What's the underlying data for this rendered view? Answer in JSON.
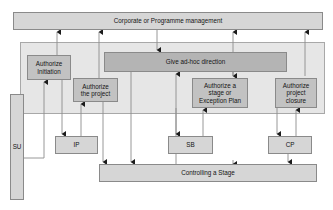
{
  "diagram": {
    "type": "process-flow-diagram",
    "colors": {
      "page_background": "#ffffff",
      "container_fill": "#e6e6e6",
      "box_fill_light": "#d6d6d6",
      "box_fill_mid": "#c2c2c2",
      "box_fill_dark": "#b4b4b4",
      "border": "#8a8a8a",
      "line": "#7a7a7a",
      "text": "#141414"
    },
    "top_banner": {
      "label": "Corporate or Programme management",
      "x": 13,
      "y": 12,
      "w": 310,
      "h": 18
    },
    "container": {
      "label": "",
      "x": 20,
      "y": 42,
      "w": 305,
      "h": 72
    },
    "processes": [
      {
        "id": "authorize-initiation",
        "label": "Authorize\nInitiation",
        "fill": "mid",
        "x": 27,
        "y": 55,
        "w": 44,
        "h": 25
      },
      {
        "id": "authorize-the-project",
        "label": "Authorize\nthe project",
        "fill": "mid",
        "x": 73,
        "y": 78,
        "w": 45,
        "h": 24
      },
      {
        "id": "give-ad-hoc-direction",
        "label": "Give ad-hoc direction",
        "fill": "dark",
        "x": 104,
        "y": 52,
        "w": 183,
        "h": 20
      },
      {
        "id": "authorize-a-stage-or-exception-plan",
        "label": "Authorize a\nstage or\nException Plan",
        "fill": "mid",
        "x": 192,
        "y": 78,
        "w": 56,
        "h": 30
      },
      {
        "id": "authorize-project-closure",
        "label": "Authorize\nproject\nclosure",
        "fill": "mid",
        "x": 275,
        "y": 78,
        "w": 42,
        "h": 30
      }
    ],
    "stage_boxes": [
      {
        "id": "su",
        "label": "SU",
        "fill": "light",
        "x": 10,
        "y": 94,
        "w": 14,
        "h": 106
      },
      {
        "id": "ip",
        "label": "IP",
        "fill": "light",
        "x": 55,
        "y": 136,
        "w": 43,
        "h": 18
      },
      {
        "id": "sb",
        "label": "SB",
        "fill": "light",
        "x": 168,
        "y": 136,
        "w": 45,
        "h": 18
      },
      {
        "id": "cp",
        "label": "CP",
        "fill": "light",
        "x": 268,
        "y": 136,
        "w": 44,
        "h": 18
      }
    ],
    "bottom_bar": {
      "id": "controlling-a-stage",
      "label": "Controlling a Stage",
      "fill": "light",
      "x": 99,
      "y": 164,
      "w": 218,
      "h": 18
    },
    "connectors": [
      {
        "id": "su-to-authorize-initiation",
        "from": "su",
        "to": "authorize-initiation"
      },
      {
        "id": "authorize-initiation-to-corporate",
        "from": "authorize-initiation",
        "to": "top-banner"
      },
      {
        "id": "authorize-initiation-to-ip",
        "from": "authorize-initiation",
        "to": "ip"
      },
      {
        "id": "ip-to-authorize-the-project",
        "from": "ip",
        "to": "authorize-the-project"
      },
      {
        "id": "authorize-the-project-to-corporate",
        "from": "authorize-the-project",
        "to": "top-banner"
      },
      {
        "id": "authorize-the-project-to-controlling",
        "from": "authorize-the-project",
        "to": "controlling-a-stage"
      },
      {
        "id": "corporate-to-give-ad-hoc",
        "from": "top-banner",
        "to": "give-ad-hoc-direction"
      },
      {
        "id": "controlling-to-give-ad-hoc",
        "from": "controlling-a-stage",
        "to": "give-ad-hoc-direction"
      },
      {
        "id": "give-ad-hoc-to-controlling",
        "from": "give-ad-hoc-direction",
        "to": "controlling-a-stage"
      },
      {
        "id": "give-ad-hoc-to-authorize-stage",
        "from": "give-ad-hoc-direction",
        "to": "authorize-a-stage-or-exception-plan"
      },
      {
        "id": "sb-to-authorize-stage",
        "from": "sb",
        "to": "authorize-a-stage-or-exception-plan"
      },
      {
        "id": "authorize-stage-to-sb",
        "from": "authorize-a-stage-or-exception-plan",
        "to": "sb"
      },
      {
        "id": "authorize-stage-to-corporate",
        "from": "authorize-a-stage-or-exception-plan",
        "to": "top-banner"
      },
      {
        "id": "cp-to-authorize-project-closure",
        "from": "cp",
        "to": "authorize-project-closure"
      },
      {
        "id": "authorize-project-closure-to-cp",
        "from": "authorize-project-closure",
        "to": "cp"
      },
      {
        "id": "authorize-project-closure-to-corporate",
        "from": "authorize-project-closure",
        "to": "top-banner"
      },
      {
        "id": "controlling-to-cp",
        "from": "controlling-a-stage",
        "to": "cp"
      }
    ]
  }
}
